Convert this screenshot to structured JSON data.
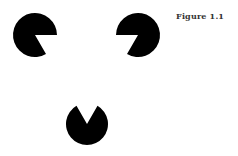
{
  "figure": {
    "caption": "Figure 1.1",
    "type": "Kanizsa triangle illusion",
    "fill_color": "#000000",
    "background": "#ffffff",
    "inducers": [
      {
        "name": "top-left",
        "cx": 35,
        "cy": 35,
        "r": 22,
        "gap_from_deg": 0,
        "gap_to_deg": 60
      },
      {
        "name": "top-right",
        "cx": 138,
        "cy": 35,
        "r": 22,
        "gap_from_deg": 120,
        "gap_to_deg": 180
      },
      {
        "name": "bottom",
        "cx": 87,
        "cy": 124,
        "r": 21,
        "gap_from_deg": 240,
        "gap_to_deg": 300
      }
    ]
  }
}
